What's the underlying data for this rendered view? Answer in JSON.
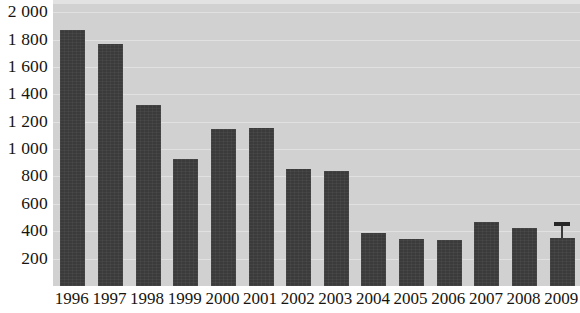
{
  "chart_data": {
    "type": "bar",
    "title": "",
    "subtitle": "",
    "xlabel": "",
    "ylabel": "",
    "categories": [
      "1996",
      "1997",
      "1998",
      "1999",
      "2000",
      "2001",
      "2002",
      "2003",
      "2004",
      "2005",
      "2006",
      "2007",
      "2008",
      "2009"
    ],
    "values": [
      1870,
      1770,
      1320,
      925,
      1145,
      1155,
      855,
      840,
      385,
      340,
      335,
      470,
      425,
      350
    ],
    "series": [
      {
        "name": "",
        "values": [
          1870,
          1770,
          1320,
          925,
          1145,
          1155,
          855,
          840,
          385,
          340,
          335,
          470,
          425,
          350
        ]
      }
    ],
    "ylim": [
      0,
      2060
    ],
    "ytick_values": [
      200,
      400,
      600,
      800,
      1000,
      1200,
      1400,
      1600,
      1800,
      2000
    ],
    "ytick_labels": [
      "200",
      "400",
      "600",
      "800",
      "1 000",
      "1 200",
      "1 400",
      "1 600",
      "1 800",
      "2 000"
    ],
    "xtick_labels": [
      "1996",
      "1997",
      "1998",
      "1999",
      "2000",
      "2001",
      "2002",
      "2003",
      "2004",
      "2005",
      "2006",
      "2007",
      "2008",
      "2009"
    ],
    "grid": true,
    "grid_axis": "y",
    "legend": false,
    "legend_position": "none",
    "annotations": [
      {
        "category": "2009",
        "type": "error-bar",
        "value": 350,
        "upper": 465,
        "lower": 350
      }
    ],
    "colors": {
      "bar": "#3b3b3b",
      "plot_background": "#d1d1d1",
      "gridline": "#e4e4e4",
      "page_background": "#ffffff",
      "tick_label": "#17150f"
    }
  }
}
